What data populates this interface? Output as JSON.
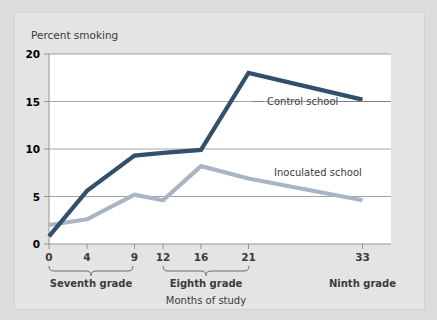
{
  "chart_data": {
    "type": "line",
    "title": "",
    "xlabel": "Months of study",
    "ylabel": "Percent smoking",
    "xlim": [
      0,
      36
    ],
    "ylim": [
      0,
      20
    ],
    "yticks": [
      0,
      5,
      10,
      15,
      20
    ],
    "xticks": [
      0,
      4,
      9,
      12,
      16,
      21,
      33
    ],
    "grid": true,
    "legend_position": "inline-annotations",
    "x": [
      0,
      4,
      9,
      12,
      16,
      21,
      33
    ],
    "series": [
      {
        "name": "Control school",
        "color": "#33506b",
        "values": [
          0.8,
          5.6,
          9.3,
          9.6,
          9.9,
          18.0,
          15.2
        ]
      },
      {
        "name": "Inoculated school",
        "color": "#a8b6c4",
        "values": [
          2.0,
          2.6,
          5.2,
          4.6,
          8.2,
          6.9,
          4.6
        ]
      }
    ],
    "group_brackets": [
      {
        "label": "Seventh grade",
        "from": 0,
        "to": 9
      },
      {
        "label": "Eighth grade",
        "from": 12,
        "to": 21
      },
      {
        "label": "Ninth grade",
        "from": 33,
        "to": 33,
        "bracket": false
      }
    ]
  },
  "axes": {
    "y_title": "Percent smoking",
    "x_caption": "Months of study",
    "y_tick_labels": [
      "20",
      "15",
      "10",
      "5",
      "0"
    ],
    "x_tick_labels": [
      "0",
      "4",
      "9",
      "12",
      "16",
      "21",
      "33"
    ]
  },
  "annotations": {
    "control_label": "Control school",
    "inoculated_label": "Inoculated school"
  },
  "groups": {
    "seventh": "Seventh grade",
    "eighth": "Eighth grade",
    "ninth": "Ninth grade"
  },
  "colors": {
    "control": "#33506b",
    "inoculated": "#a8b6c4",
    "page_background": "#dcdcdc",
    "card_background": "#e4e4e4",
    "plot_background": "#ffffff",
    "grid": "#8b8b8b",
    "text": "#3b3b3b"
  }
}
